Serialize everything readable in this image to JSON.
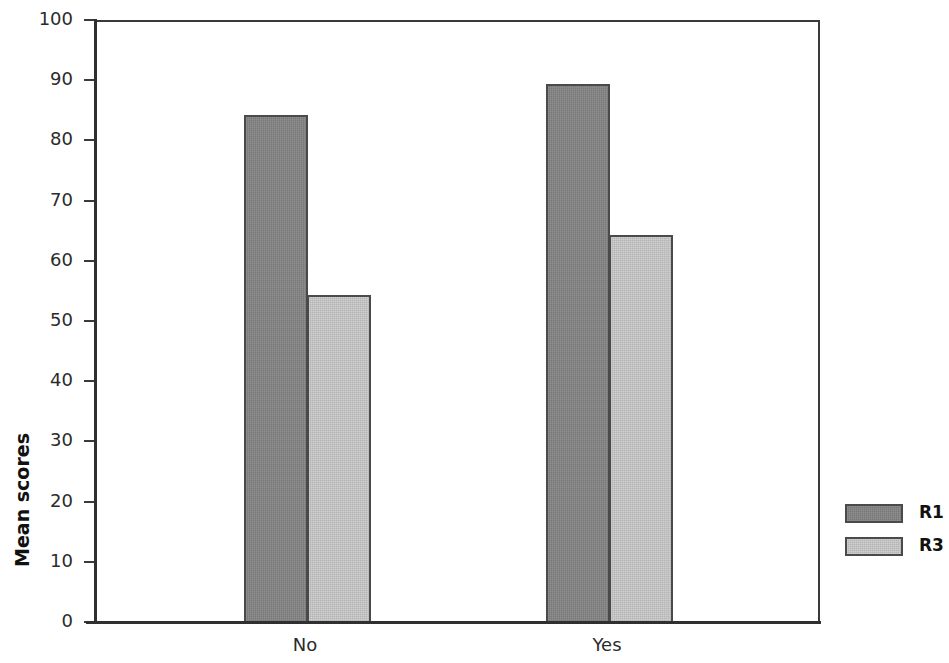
{
  "chart_data": {
    "type": "bar",
    "title": "",
    "subtitle": "",
    "xlabel": "",
    "ylabel": "Mean scores",
    "categories": [
      "No",
      "Yes"
    ],
    "series": [
      {
        "name": "R1",
        "values": [
          84.5,
          89.7
        ],
        "color": "#848484"
      },
      {
        "name": "R3",
        "values": [
          54.7,
          64.6
        ],
        "color": "#c9c9c9"
      }
    ],
    "ylim": [
      0,
      100
    ],
    "ytick_labels": [
      "100",
      "90",
      "80",
      "70",
      "60",
      "50",
      "40",
      "30",
      "20",
      "10",
      "0"
    ],
    "ytick_values": [
      100,
      90,
      80,
      70,
      60,
      50,
      40,
      30,
      20,
      10,
      0
    ],
    "grid": false,
    "legend_position": "right",
    "legend_entries": [
      "R1",
      "R3"
    ],
    "bar_border_color": "#4a4a4a",
    "axis_color": "#303030",
    "background": "#ffffff"
  },
  "axis": {
    "y_title": "Mean scores"
  }
}
